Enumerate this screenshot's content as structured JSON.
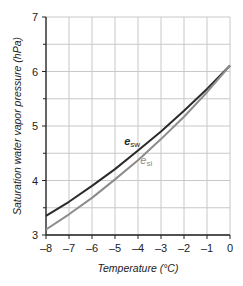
{
  "chart_data": {
    "type": "line",
    "title": "",
    "xlabel": "Temperature (°C)",
    "ylabel": "Saturation water vapor pressure (hPa)",
    "xlim": [
      -8,
      0
    ],
    "ylim": [
      3,
      7
    ],
    "x_ticks": [
      -8,
      -7,
      -6,
      -5,
      -4,
      -3,
      -2,
      -1,
      0
    ],
    "x_tick_labels": [
      "–8",
      "–7",
      "–6",
      "–5",
      "–4",
      "–3",
      "–2",
      "–1",
      "0"
    ],
    "y_ticks": [
      3,
      4,
      5,
      6,
      7
    ],
    "y_minor_ticks": [
      3.5,
      4.5,
      5.5,
      6.5
    ],
    "grid": true,
    "x": [
      -8,
      -7,
      -6,
      -5,
      -4,
      -3,
      -2,
      -1,
      0
    ],
    "series": [
      {
        "name": "e_sw",
        "label_main": "e",
        "label_sub": "sw",
        "color": "#2b2b2b",
        "values": [
          3.35,
          3.61,
          3.9,
          4.21,
          4.55,
          4.9,
          5.28,
          5.68,
          6.11
        ]
      },
      {
        "name": "e_si",
        "label_main": "e",
        "label_sub": "si",
        "color": "#8c8c8c",
        "values": [
          3.1,
          3.38,
          3.68,
          4.02,
          4.37,
          4.76,
          5.17,
          5.62,
          6.11
        ]
      }
    ],
    "annotations": [
      {
        "text": "e_sw",
        "x": -4.6,
        "y": 4.65
      },
      {
        "text": "e_si",
        "x": -3.9,
        "y": 4.3
      }
    ]
  }
}
